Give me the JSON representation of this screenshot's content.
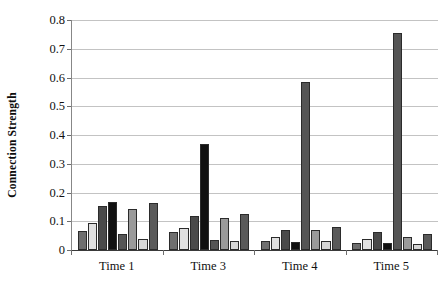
{
  "chart_data": {
    "type": "bar",
    "title": "",
    "subtitle": "",
    "xlabel": "",
    "ylabel": "Connection Strength",
    "categories": [
      "Time 1",
      "Time 3",
      "Time 4",
      "Time 5"
    ],
    "ylim": [
      0,
      0.8
    ],
    "ytick_labels": [
      "0",
      "0.1",
      "0.2",
      "0.3",
      "0.4",
      "0.5",
      "0.6",
      "0.7",
      "0.8"
    ],
    "ytick_values": [
      0,
      0.1,
      0.2,
      0.3,
      0.4,
      0.5,
      0.6,
      0.7,
      0.8
    ],
    "grid": true,
    "legend": "none",
    "legend_position": "none",
    "series": [
      {
        "name": "Series 1",
        "color": "#6e6e6e",
        "values": [
          0.065,
          0.063,
          0.031,
          0.024
        ]
      },
      {
        "name": "Series 2",
        "color": "#e0e0e0",
        "values": [
          0.095,
          0.077,
          0.046,
          0.04
        ]
      },
      {
        "name": "Series 3",
        "color": "#4a4a4a",
        "values": [
          0.153,
          0.118,
          0.071,
          0.062
        ]
      },
      {
        "name": "Series 4",
        "color": "#111111",
        "values": [
          0.168,
          0.37,
          0.027,
          0.023
        ]
      },
      {
        "name": "Series 5",
        "color": "#555555",
        "values": [
          0.057,
          0.036,
          0.583,
          0.755
        ]
      },
      {
        "name": "Series 6",
        "color": "#9a9a9a",
        "values": [
          0.143,
          0.112,
          0.069,
          0.044
        ]
      },
      {
        "name": "Series 7",
        "color": "#d6d6d6",
        "values": [
          0.04,
          0.03,
          0.03,
          0.022
        ]
      },
      {
        "name": "Series 8",
        "color": "#5a5a5a",
        "values": [
          0.162,
          0.126,
          0.08,
          0.057
        ]
      }
    ]
  }
}
